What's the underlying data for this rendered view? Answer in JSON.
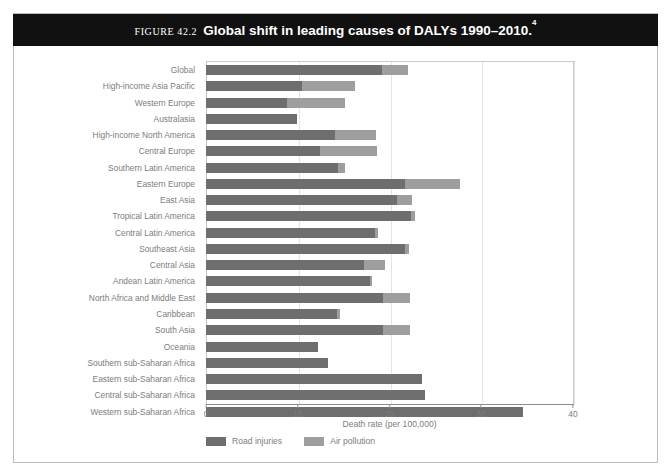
{
  "figure": {
    "label": "FIGURE 42.2",
    "title": "Global shift in leading causes of DALYs 1990–2010.",
    "superscript": "4"
  },
  "colors": {
    "road_injuries": "#6e6e6e",
    "air_pollution": "#9e9e9e",
    "title_band": "#111111",
    "text": "#7d7d7d",
    "frame": "#bdbdbd"
  },
  "legend": {
    "position": "bottom-left",
    "items": [
      {
        "name": "Road injuries",
        "color": "#6e6e6e"
      },
      {
        "name": "Air pollution",
        "color": "#9e9e9e"
      }
    ]
  },
  "chart_data": {
    "type": "bar",
    "orientation": "horizontal",
    "stacked": true,
    "title": "Global shift in leading causes of DALYs 1990–2010.",
    "xlabel": "Death rate (per 100,000)",
    "ylabel": "",
    "xlim": [
      0,
      40
    ],
    "xticks": [
      0,
      10,
      20,
      30,
      40
    ],
    "grid": true,
    "legend_position": "bottom-left",
    "categories": [
      "Global",
      "High-income Asia Pacific",
      "Western Europe",
      "Australasia",
      "High-income North America",
      "Central Europe",
      "Southern Latin America",
      "Eastern Europe",
      "East Asia",
      "Tropical Latin America",
      "Central Latin America",
      "Southeast Asia",
      "Central Asia",
      "Andean Latin America",
      "North Africa and Middle East",
      "Caribbean",
      "South Asia",
      "Oceania",
      "Southern sub-Saharan Africa",
      "Eastern sub-Saharan Africa",
      "Central sub-Saharan Africa",
      "Western sub-Saharan Africa"
    ],
    "series": [
      {
        "name": "Road injuries",
        "color": "#6e6e6e",
        "values": [
          19.2,
          10.5,
          8.8,
          9.9,
          14.1,
          12.4,
          14.4,
          21.7,
          20.8,
          22.3,
          18.4,
          21.7,
          17.2,
          17.9,
          19.3,
          14.3,
          19.3,
          12.2,
          13.3,
          23.5,
          23.9,
          34.5
        ]
      },
      {
        "name": "Air pollution",
        "color": "#9e9e9e",
        "values": [
          2.8,
          5.7,
          6.3,
          0.0,
          4.4,
          6.2,
          0.7,
          6.0,
          1.7,
          0.5,
          0.3,
          0.4,
          2.3,
          0.2,
          2.9,
          0.3,
          2.9,
          0.0,
          0.0,
          0.0,
          0.0,
          0.0
        ]
      }
    ],
    "totals": [
      22.0,
      16.2,
      15.1,
      9.9,
      18.5,
      18.6,
      15.1,
      27.7,
      22.5,
      22.8,
      18.7,
      22.1,
      19.5,
      18.1,
      22.2,
      14.6,
      22.2,
      12.2,
      13.3,
      23.5,
      23.9,
      34.5
    ]
  }
}
